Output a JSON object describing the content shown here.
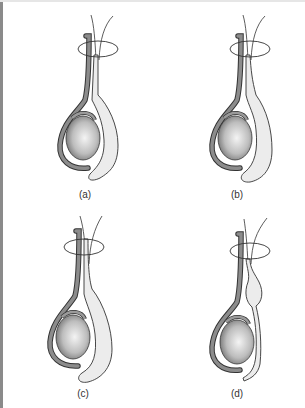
{
  "figure": {
    "panels": [
      {
        "id": "a",
        "label": "(a)",
        "variant": "sac-full-wide"
      },
      {
        "id": "b",
        "label": "(b)",
        "variant": "sac-full-narrow"
      },
      {
        "id": "c",
        "label": "(c)",
        "variant": "sac-full-extends-high"
      },
      {
        "id": "d",
        "label": "(d)",
        "variant": "sac-narrow-bulge-upper"
      }
    ],
    "colors": {
      "outline": "#333333",
      "tube": "#8c8c8c",
      "testis_light": "#f2f2f2",
      "testis_dark": "#6e6e6e",
      "sac_fill": "#ececec",
      "left_border": "#8a8a8a"
    }
  }
}
